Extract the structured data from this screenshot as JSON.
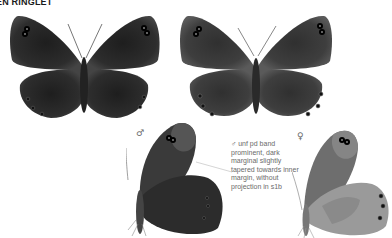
{
  "page": {
    "title": "EN RINGLET"
  },
  "figures": [
    {
      "id": "male-upperside",
      "view": "upperside",
      "sex": "male"
    },
    {
      "id": "female-upperside",
      "view": "upperside",
      "sex": "female"
    },
    {
      "id": "male-underside",
      "view": "underside",
      "sex": "male",
      "sex_symbol": "♂"
    },
    {
      "id": "female-underside",
      "view": "underside",
      "sex": "female",
      "sex_symbol": "♀"
    }
  ],
  "annotation": {
    "text": "♂ unf pd band prominent, dark marginal slightly tapered towards inner margin, without projection in s1b"
  },
  "colors": {
    "male_wing": "#2b2b2b",
    "female_wing": "#3d3d3d",
    "underside_hind_female": "#9a9a9a",
    "text": "#6a6a6a"
  }
}
